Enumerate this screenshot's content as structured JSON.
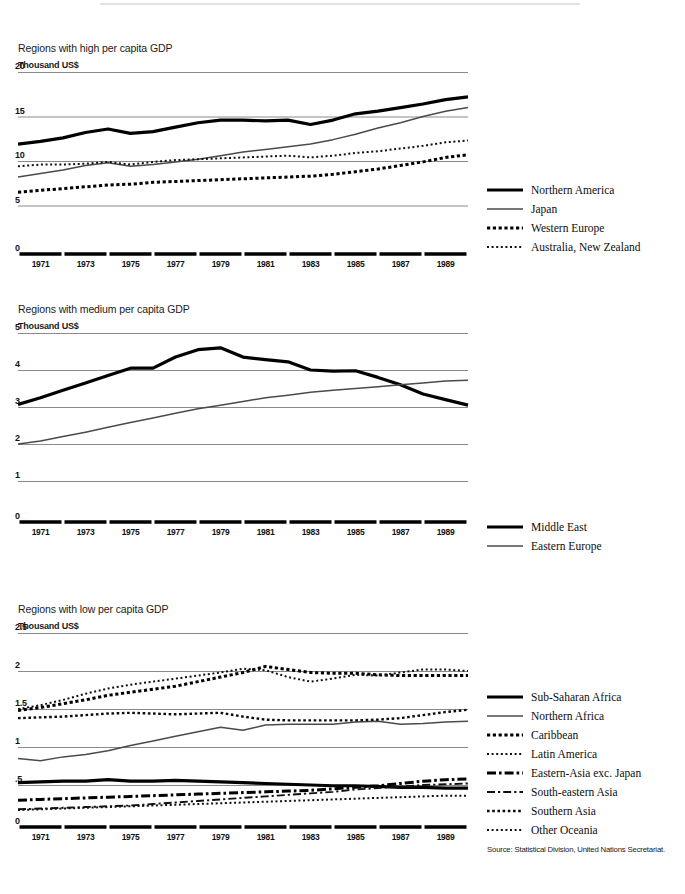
{
  "source_note": "Source: Statistical Division, United Nations Secretariat.",
  "panels": [
    {
      "title": "Regions with high per capita GDP",
      "unit": "Thousand US$",
      "y_ticks": [
        "20",
        "15",
        "10",
        "5",
        "0"
      ],
      "x_ticks": [
        "1971",
        "1973",
        "1975",
        "1977",
        "1979",
        "1981",
        "1983",
        "1985",
        "1987",
        "1989"
      ],
      "legend": [
        {
          "label": "Northern America",
          "style": "thick-solid"
        },
        {
          "label": "Japan",
          "style": "thin-solid"
        },
        {
          "label": "Western Europe",
          "style": "bold-dotted"
        },
        {
          "label": "Australia, New Zealand",
          "style": "fine-dotted"
        }
      ]
    },
    {
      "title": "Regions with medium per capita GDP",
      "unit": "Thousand US$",
      "y_ticks": [
        "5",
        "4",
        "3",
        "2",
        "1",
        "0"
      ],
      "x_ticks": [
        "1971",
        "1973",
        "1975",
        "1977",
        "1979",
        "1981",
        "1983",
        "1985",
        "1987",
        "1989"
      ],
      "legend": [
        {
          "label": "Middle East",
          "style": "thick-solid"
        },
        {
          "label": "Eastern Europe",
          "style": "thin-solid"
        }
      ]
    },
    {
      "title": "Regions with low per capita GDP",
      "unit": "Thousand US$",
      "y_ticks": [
        "2.5",
        "2",
        "1.5",
        "1",
        ".5",
        "0"
      ],
      "x_ticks": [
        "1971",
        "1973",
        "1975",
        "1977",
        "1979",
        "1981",
        "1983",
        "1985",
        "1987",
        "1989"
      ],
      "legend": [
        {
          "label": "Sub-Saharan Africa",
          "style": "thick-solid"
        },
        {
          "label": "Northern Africa",
          "style": "thin-solid"
        },
        {
          "label": "Caribbean",
          "style": "bold-dotted"
        },
        {
          "label": "Latin America",
          "style": "fine-dotted"
        },
        {
          "label": "Eastern-Asia exc. Japan",
          "style": "bold-dashdot"
        },
        {
          "label": "South-eastern Asia",
          "style": "thin-dashdot"
        },
        {
          "label": "Southern Asia",
          "style": "med-dotted"
        },
        {
          "label": "Other Oceania",
          "style": "fine-dotted"
        }
      ]
    }
  ],
  "chart_data": [
    {
      "type": "line",
      "title": "Regions with high per capita GDP",
      "ylabel": "Thousand US$",
      "xlabel": "",
      "ylim": [
        0,
        20
      ],
      "yticks": [
        0,
        5,
        10,
        15,
        20
      ],
      "grid": true,
      "legend_position": "right",
      "x": [
        1970,
        1971,
        1972,
        1973,
        1974,
        1975,
        1976,
        1977,
        1978,
        1979,
        1980,
        1981,
        1982,
        1983,
        1984,
        1985,
        1986,
        1987,
        1988,
        1989,
        1990
      ],
      "series": [
        {
          "name": "Northern America",
          "style": "thick-solid",
          "values": [
            11.9,
            12.2,
            12.6,
            13.2,
            13.6,
            13.1,
            13.3,
            13.8,
            14.3,
            14.6,
            14.6,
            14.5,
            14.6,
            14.1,
            14.6,
            15.3,
            15.6,
            16.0,
            16.4,
            16.9,
            17.2
          ]
        },
        {
          "name": "Japan",
          "style": "thin-solid",
          "values": [
            8.2,
            8.6,
            9.0,
            9.5,
            9.8,
            9.4,
            9.6,
            9.9,
            10.2,
            10.6,
            11.0,
            11.3,
            11.6,
            11.9,
            12.4,
            13.0,
            13.7,
            14.3,
            15.0,
            15.6,
            16.0
          ]
        },
        {
          "name": "Western Europe",
          "style": "bold-dotted",
          "values": [
            6.5,
            6.7,
            6.9,
            7.1,
            7.3,
            7.4,
            7.6,
            7.7,
            7.8,
            7.9,
            8.0,
            8.1,
            8.2,
            8.3,
            8.5,
            8.8,
            9.1,
            9.5,
            9.9,
            10.4,
            10.7
          ]
        },
        {
          "name": "Australia, New Zealand",
          "style": "fine-dotted",
          "values": [
            9.4,
            9.6,
            9.6,
            9.7,
            9.9,
            9.6,
            9.9,
            10.1,
            10.2,
            10.3,
            10.4,
            10.5,
            10.6,
            10.4,
            10.6,
            10.9,
            11.1,
            11.4,
            11.7,
            12.1,
            12.3
          ]
        }
      ]
    },
    {
      "type": "line",
      "title": "Regions with medium per capita GDP",
      "ylabel": "Thousand US$",
      "xlabel": "",
      "ylim": [
        0,
        5
      ],
      "yticks": [
        0,
        1,
        2,
        3,
        4,
        5
      ],
      "grid": true,
      "legend_position": "right",
      "x": [
        1970,
        1971,
        1972,
        1973,
        1974,
        1975,
        1976,
        1977,
        1978,
        1979,
        1980,
        1981,
        1982,
        1983,
        1984,
        1985,
        1986,
        1987,
        1988,
        1989,
        1990
      ],
      "series": [
        {
          "name": "Middle East",
          "style": "thick-solid",
          "values": [
            3.07,
            3.25,
            3.45,
            3.65,
            3.85,
            4.05,
            4.05,
            4.35,
            4.55,
            4.6,
            4.35,
            4.28,
            4.22,
            4.0,
            3.97,
            3.98,
            3.8,
            3.6,
            3.35,
            3.2,
            3.05
          ]
        },
        {
          "name": "Eastern Europe",
          "style": "thin-solid",
          "values": [
            2.0,
            2.08,
            2.2,
            2.32,
            2.45,
            2.58,
            2.7,
            2.83,
            2.95,
            3.05,
            3.15,
            3.25,
            3.32,
            3.4,
            3.45,
            3.5,
            3.55,
            3.6,
            3.65,
            3.7,
            3.72
          ]
        }
      ]
    },
    {
      "type": "line",
      "title": "Regions with low per capita GDP",
      "ylabel": "Thousand US$",
      "xlabel": "",
      "ylim": [
        0,
        2.5
      ],
      "yticks": [
        0,
        0.5,
        1,
        1.5,
        2,
        2.5
      ],
      "grid": true,
      "legend_position": "right",
      "x": [
        1970,
        1971,
        1972,
        1973,
        1974,
        1975,
        1976,
        1977,
        1978,
        1979,
        1980,
        1981,
        1982,
        1983,
        1984,
        1985,
        1986,
        1987,
        1988,
        1989,
        1990
      ],
      "series": [
        {
          "name": "Sub-Saharan Africa",
          "style": "thick-solid",
          "values": [
            0.53,
            0.54,
            0.55,
            0.55,
            0.57,
            0.55,
            0.55,
            0.56,
            0.55,
            0.54,
            0.53,
            0.52,
            0.51,
            0.5,
            0.49,
            0.49,
            0.48,
            0.47,
            0.47,
            0.46,
            0.46
          ]
        },
        {
          "name": "Northern Africa",
          "style": "thin-solid",
          "values": [
            0.85,
            0.82,
            0.87,
            0.9,
            0.95,
            1.02,
            1.08,
            1.14,
            1.2,
            1.26,
            1.22,
            1.29,
            1.3,
            1.3,
            1.3,
            1.33,
            1.34,
            1.3,
            1.31,
            1.33,
            1.34
          ]
        },
        {
          "name": "Caribbean",
          "style": "bold-dotted",
          "values": [
            1.48,
            1.52,
            1.57,
            1.62,
            1.68,
            1.72,
            1.76,
            1.8,
            1.86,
            1.92,
            1.98,
            2.06,
            2.02,
            1.98,
            1.97,
            1.97,
            1.95,
            1.94,
            1.94,
            1.94,
            1.94
          ]
        },
        {
          "name": "Latin America",
          "style": "fine-dotted",
          "values": [
            1.5,
            1.55,
            1.62,
            1.7,
            1.77,
            1.82,
            1.86,
            1.9,
            1.94,
            1.98,
            2.03,
            2.01,
            1.92,
            1.86,
            1.9,
            1.95,
            1.94,
            1.98,
            2.02,
            2.02,
            2.0
          ]
        },
        {
          "name": "Eastern-Asia exc. Japan",
          "style": "bold-dashdot",
          "values": [
            0.3,
            0.31,
            0.32,
            0.33,
            0.34,
            0.35,
            0.36,
            0.37,
            0.38,
            0.39,
            0.4,
            0.41,
            0.42,
            0.43,
            0.45,
            0.47,
            0.49,
            0.52,
            0.55,
            0.57,
            0.58
          ]
        },
        {
          "name": "South-eastern Asia",
          "style": "thin-dashdot",
          "values": [
            0.18,
            0.19,
            0.2,
            0.21,
            0.22,
            0.23,
            0.25,
            0.27,
            0.29,
            0.31,
            0.33,
            0.35,
            0.37,
            0.39,
            0.41,
            0.44,
            0.46,
            0.48,
            0.5,
            0.51,
            0.52
          ]
        },
        {
          "name": "Southern Asia",
          "style": "med-dotted",
          "values": [
            1.38,
            1.39,
            1.4,
            1.42,
            1.44,
            1.45,
            1.44,
            1.43,
            1.44,
            1.45,
            1.4,
            1.36,
            1.35,
            1.35,
            1.35,
            1.35,
            1.36,
            1.38,
            1.42,
            1.46,
            1.49
          ]
        },
        {
          "name": "Other Oceania",
          "style": "fine-dotted",
          "values": [
            0.17,
            0.18,
            0.19,
            0.2,
            0.21,
            0.22,
            0.23,
            0.24,
            0.25,
            0.26,
            0.27,
            0.28,
            0.29,
            0.3,
            0.31,
            0.32,
            0.33,
            0.34,
            0.35,
            0.36,
            0.36
          ]
        }
      ]
    }
  ]
}
